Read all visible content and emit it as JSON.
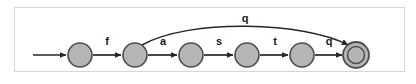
{
  "figure": {
    "name": "finite-state-automaton",
    "frame": {
      "x": 14,
      "y": 7,
      "width": 391,
      "height": 65,
      "border_color": "#d6d6d6",
      "background": "#ffffff"
    },
    "colors": {
      "state_fill": "#b5b5b5",
      "state_stroke": "#4d4d4d",
      "edge_color": "#262626",
      "label_color": "#1a1a1a",
      "accept_inner_fill": "#b5b5b5"
    },
    "baseline_y": 55,
    "state_radius": 12,
    "accept_outer_radius": 13,
    "accept_inner_radius": 8.5
  },
  "states": [
    {
      "id": "q0",
      "label": "",
      "cx": 80,
      "cy": 55,
      "type": "normal",
      "accepting": false
    },
    {
      "id": "q1",
      "label": "",
      "cx": 135,
      "cy": 55,
      "type": "normal",
      "accepting": false
    },
    {
      "id": "q2",
      "label": "",
      "cx": 191,
      "cy": 55,
      "type": "normal",
      "accepting": false
    },
    {
      "id": "q3",
      "label": "",
      "cx": 247,
      "cy": 55,
      "type": "normal",
      "accepting": false
    },
    {
      "id": "q4",
      "label": "",
      "cx": 302,
      "cy": 55,
      "type": "normal",
      "accepting": false
    },
    {
      "id": "q5",
      "label": "",
      "cx": 356,
      "cy": 55,
      "type": "accept",
      "accepting": true
    }
  ],
  "start": {
    "name": "start-arrow",
    "from_x": 33,
    "to_x": 66,
    "y": 55
  },
  "transitions": [
    {
      "id": "t-f",
      "from": "q0",
      "to": "q1",
      "label": "f",
      "shape": "straight",
      "label_x": 107,
      "label_y": 45
    },
    {
      "id": "t-a",
      "from": "q1",
      "to": "q2",
      "label": "a",
      "shape": "straight",
      "label_x": 163,
      "label_y": 45
    },
    {
      "id": "t-s",
      "from": "q2",
      "to": "q3",
      "label": "s",
      "shape": "straight",
      "label_x": 219,
      "label_y": 45
    },
    {
      "id": "t-t",
      "from": "q3",
      "to": "q4",
      "label": "t",
      "shape": "straight",
      "label_x": 275,
      "label_y": 45
    },
    {
      "id": "t-q",
      "from": "q4",
      "to": "q5",
      "label": "q",
      "shape": "straight",
      "label_x": 329,
      "label_y": 45
    },
    {
      "id": "t-q-arc",
      "from": "q1",
      "to": "q5",
      "label": "q",
      "shape": "arc",
      "label_x": 245,
      "label_y": 22
    }
  ],
  "alphabet": [
    "f",
    "a",
    "s",
    "t",
    "q"
  ]
}
